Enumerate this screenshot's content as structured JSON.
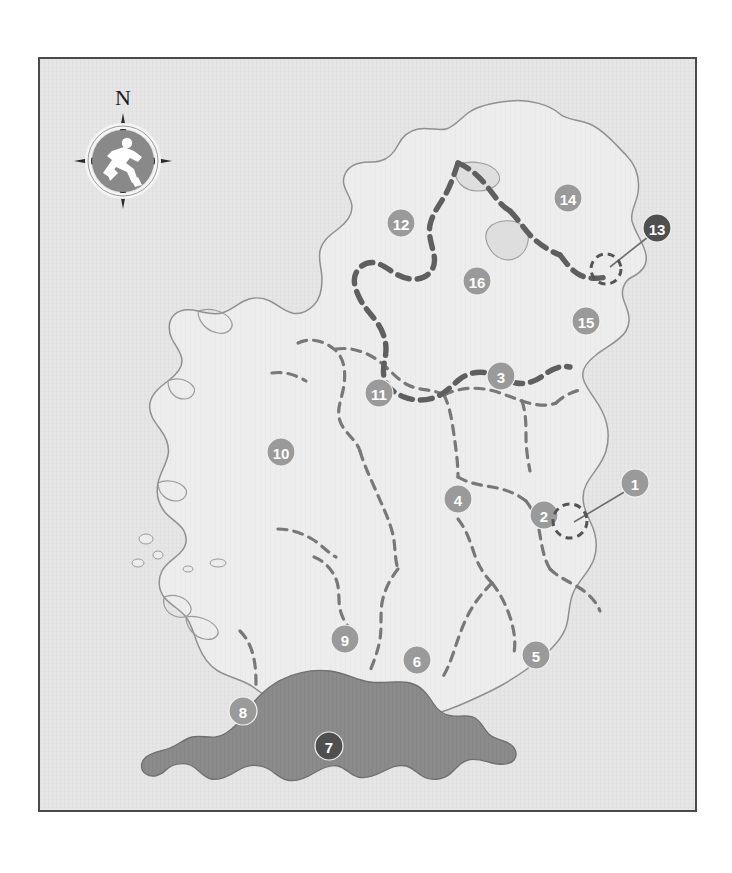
{
  "figure": {
    "frame_color": "#4b4b4b",
    "panel_background": "#e8e8e8"
  },
  "compass": {
    "north_label": "N",
    "icon": "running-person-icon",
    "dial_color": "#878787",
    "ring_color": "#f4f4f4",
    "needle_color": "#2a2a2a"
  },
  "legend_colors": {
    "land_fill": "#ececec",
    "sea_fill": "#e4e4e4",
    "coastline": "#8c8c8c",
    "county_border": "#6f6f6f",
    "national_border": "#5a5a5a",
    "highlight_fill": "#8a8a8a",
    "marker_light": "#9a9a9a",
    "marker_dark": "#4f4f4f",
    "marker_text": "#ffffff"
  },
  "markers": [
    {
      "id": 1,
      "label": "1",
      "x": 595,
      "y": 424,
      "tone": "light",
      "leader": {
        "x1": 586,
        "y1": 432,
        "x2": 534,
        "y2": 463
      }
    },
    {
      "id": 2,
      "label": "2",
      "x": 504,
      "y": 456,
      "tone": "light",
      "leader": null
    },
    {
      "id": 3,
      "label": "3",
      "x": 461,
      "y": 317,
      "tone": "light",
      "leader": null
    },
    {
      "id": 4,
      "label": "4",
      "x": 418,
      "y": 440,
      "tone": "light",
      "leader": null
    },
    {
      "id": 5,
      "label": "5",
      "x": 496,
      "y": 596,
      "tone": "light",
      "leader": null
    },
    {
      "id": 6,
      "label": "6",
      "x": 377,
      "y": 601,
      "tone": "light",
      "leader": null
    },
    {
      "id": 7,
      "label": "7",
      "x": 289,
      "y": 687,
      "tone": "dark",
      "leader": null
    },
    {
      "id": 8,
      "label": "8",
      "x": 203,
      "y": 652,
      "tone": "light",
      "leader": null
    },
    {
      "id": 9,
      "label": "9",
      "x": 305,
      "y": 580,
      "tone": "light",
      "leader": null
    },
    {
      "id": 10,
      "label": "10",
      "x": 241,
      "y": 393,
      "tone": "light",
      "leader": null
    },
    {
      "id": 11,
      "label": "11",
      "x": 339,
      "y": 334,
      "tone": "light",
      "leader": null
    },
    {
      "id": 12,
      "label": "12",
      "x": 361,
      "y": 164,
      "tone": "light",
      "leader": null
    },
    {
      "id": 13,
      "label": "13",
      "x": 617,
      "y": 169,
      "tone": "dark",
      "leader": {
        "x1": 608,
        "y1": 178,
        "x2": 570,
        "y2": 208
      }
    },
    {
      "id": 14,
      "label": "14",
      "x": 528,
      "y": 139,
      "tone": "light",
      "leader": null
    },
    {
      "id": 15,
      "label": "15",
      "x": 546,
      "y": 262,
      "tone": "light",
      "leader": null
    },
    {
      "id": 16,
      "label": "16",
      "x": 437,
      "y": 222,
      "tone": "light",
      "leader": null
    }
  ],
  "highlighted_region": {
    "marker_id": 7,
    "description": "Shaded region in the south-west of the island"
  }
}
